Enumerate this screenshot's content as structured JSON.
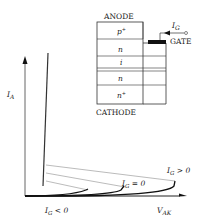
{
  "device": {
    "anode_label": "ANODE",
    "cathode_label": "CATHODE",
    "gate_label": "GATE",
    "gate_current_label": "I",
    "gate_current_sub": "G",
    "layers": [
      {
        "label": "p",
        "sup": "+"
      },
      {
        "label": "n",
        "sup": ""
      },
      {
        "label": "i",
        "sup": ""
      },
      {
        "label": "n",
        "sup": ""
      },
      {
        "label": "n",
        "sup": "+"
      }
    ]
  },
  "plot": {
    "y_axis_label": "I",
    "y_axis_sub": "A",
    "x_axis_label": "V",
    "x_axis_sub": "AK",
    "curves": [
      {
        "label": "I",
        "sub": "G",
        "cond": " < 0"
      },
      {
        "label": "I",
        "sub": "G",
        "cond": " = 0"
      },
      {
        "label": "I",
        "sub": "G",
        "cond": " > 0"
      }
    ]
  }
}
